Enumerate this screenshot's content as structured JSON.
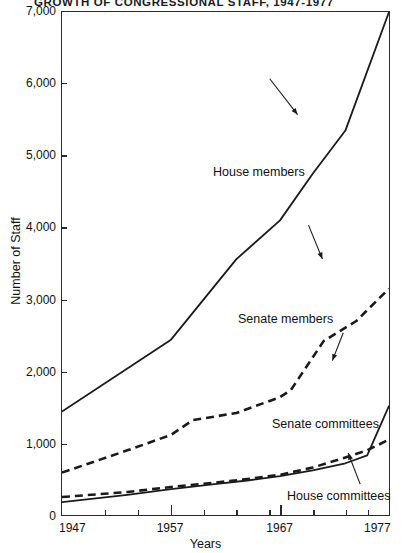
{
  "chart_data": {
    "type": "line",
    "title": "GROWTH OF CONGRESSIONAL STAFF, 1947-1977",
    "xlabel": "Years",
    "ylabel": "Number of Staff",
    "xlim": [
      1947,
      1977
    ],
    "ylim": [
      0,
      7000
    ],
    "grid": false,
    "legend_position": "inline-annotations",
    "yticks": [
      0,
      1000,
      2000,
      3000,
      4000,
      5000,
      6000,
      7000
    ],
    "ytick_labels": [
      "0",
      "1,000",
      "2,000",
      "3,000",
      "4,000",
      "5,000",
      "6,000",
      "7,000"
    ],
    "xticks": [
      1947,
      1951,
      1954,
      1957,
      1960,
      1963,
      1966,
      1967,
      1970,
      1973,
      1975,
      1977
    ],
    "xtick_labels": [
      {
        "year": 1947,
        "label": "1947"
      },
      {
        "year": 1957,
        "label": "1957"
      },
      {
        "year": 1967,
        "label": "1967"
      },
      {
        "year": 1977,
        "label": "1977"
      }
    ],
    "series": [
      {
        "name": "House members",
        "style": "solid",
        "color": "#1a1a1a",
        "points": [
          [
            1947,
            1440
          ],
          [
            1957,
            2440
          ],
          [
            1960,
            3000
          ],
          [
            1963,
            3560
          ],
          [
            1967,
            4100
          ],
          [
            1970,
            4750
          ],
          [
            1973,
            5350
          ],
          [
            1977,
            7000
          ]
        ]
      },
      {
        "name": "Senate members",
        "style": "dashed",
        "color": "#1a1a1a",
        "points": [
          [
            1947,
            590
          ],
          [
            1953,
            900
          ],
          [
            1957,
            1115
          ],
          [
            1959,
            1320
          ],
          [
            1963,
            1420
          ],
          [
            1967,
            1640
          ],
          [
            1968,
            1740
          ],
          [
            1971,
            2420
          ],
          [
            1974,
            2700
          ],
          [
            1977,
            3150
          ]
        ]
      },
      {
        "name": "Senate committees",
        "style": "dashed",
        "color": "#1a1a1a",
        "points": [
          [
            1947,
            250
          ],
          [
            1953,
            320
          ],
          [
            1957,
            390
          ],
          [
            1961,
            450
          ],
          [
            1964,
            500
          ],
          [
            1967,
            560
          ],
          [
            1970,
            660
          ],
          [
            1973,
            800
          ],
          [
            1975,
            900
          ],
          [
            1977,
            1050
          ]
        ]
      },
      {
        "name": "House committees",
        "style": "solid",
        "color": "#1a1a1a",
        "points": [
          [
            1947,
            180
          ],
          [
            1953,
            280
          ],
          [
            1957,
            360
          ],
          [
            1961,
            430
          ],
          [
            1964,
            480
          ],
          [
            1967,
            540
          ],
          [
            1970,
            620
          ],
          [
            1973,
            720
          ],
          [
            1975,
            830
          ],
          [
            1977,
            1520
          ]
        ]
      }
    ],
    "annotations": [
      {
        "text": "House members",
        "target_year": 1967,
        "target_value": 4150
      },
      {
        "text": "Senate members",
        "target_year": 1969,
        "target_value": 1900
      },
      {
        "text": "Senate committees",
        "target_year": 1971,
        "target_value": 720
      },
      {
        "text": "House committees",
        "target_year": 1973,
        "target_value": 700
      }
    ]
  }
}
